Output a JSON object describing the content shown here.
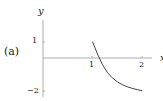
{
  "panel_label": "(a)",
  "chart_data": {
    "type": "line",
    "title": "",
    "xlabel": "x",
    "ylabel": "y",
    "xlim": [
      0,
      2.2
    ],
    "ylim": [
      -2,
      1.5
    ],
    "x_ticks": [
      "1",
      "2"
    ],
    "y_ticks": [
      "1",
      "-2"
    ],
    "grid": false,
    "series": [
      {
        "name": "curve",
        "x": [
          1.0,
          1.1,
          1.2,
          1.3,
          1.4,
          1.5,
          1.6,
          1.7,
          1.8,
          1.9,
          2.0
        ],
        "y": [
          1.0,
          0.24,
          -0.4,
          -0.89,
          -1.22,
          -1.46,
          -1.63,
          -1.76,
          -1.86,
          -1.94,
          -2.0
        ]
      }
    ]
  },
  "colors": {
    "axis": "#999999",
    "curve": "#444444",
    "text": "#222222"
  }
}
